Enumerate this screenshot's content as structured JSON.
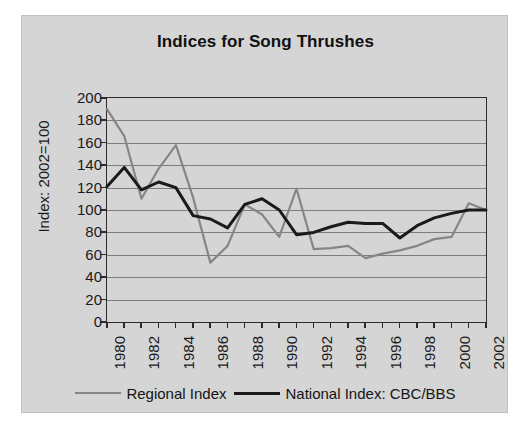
{
  "chart_data": {
    "type": "line",
    "title": "Indices for Song Thrushes",
    "xlabel": "",
    "ylabel": "Index: 2002=100",
    "xlim": [
      1980,
      2002
    ],
    "ylim": [
      0,
      200
    ],
    "yticks": [
      0,
      20,
      40,
      60,
      80,
      100,
      120,
      140,
      160,
      180,
      200
    ],
    "ytick_labels": [
      "0",
      "20",
      "40",
      "60",
      "80",
      "100",
      "120",
      "140",
      "160",
      "180",
      "200"
    ],
    "x": [
      1980,
      1981,
      1982,
      1983,
      1984,
      1985,
      1986,
      1987,
      1988,
      1989,
      1990,
      1991,
      1992,
      1993,
      1994,
      1995,
      1996,
      1997,
      1998,
      1999,
      2000,
      2001,
      2002
    ],
    "xticks": [
      1980,
      1981,
      1982,
      1983,
      1984,
      1985,
      1986,
      1987,
      1988,
      1989,
      1990,
      1991,
      1992,
      1993,
      1994,
      1995,
      1996,
      1997,
      1998,
      1999,
      2000,
      2001,
      2002
    ],
    "xtick_labels": [
      "1980",
      "",
      "1982",
      "",
      "1984",
      "",
      "1986",
      "",
      "1988",
      "",
      "1990",
      "",
      "1992",
      "",
      "1994",
      "",
      "1996",
      "",
      "1998",
      "",
      "2000",
      "",
      "2002"
    ],
    "grid": true,
    "grid_axis": "y",
    "legend_position": "bottom",
    "series": [
      {
        "name": "Regional Index",
        "color": "#868686",
        "linewidth": 2.2,
        "values": [
          190,
          166,
          110,
          137,
          158,
          111,
          53,
          68,
          105,
          96,
          76,
          119,
          65,
          66,
          68,
          57,
          61,
          64,
          68,
          74,
          76,
          106,
          100
        ]
      },
      {
        "name": "National Index: CBC/BBS",
        "color": "#1a1a1a",
        "linewidth": 3,
        "values": [
          121,
          138,
          118,
          125,
          120,
          95,
          92,
          84,
          105,
          110,
          100,
          78,
          80,
          85,
          89,
          88,
          88,
          75,
          86,
          93,
          97,
          100,
          100
        ]
      }
    ]
  },
  "legend": {
    "entries": [
      {
        "label": "Regional Index",
        "swatch": "regional"
      },
      {
        "label": "National Index: CBC/BBS",
        "swatch": "national"
      }
    ]
  },
  "colors": {
    "figure_background": "#d5d5d5",
    "page_background": "#ffffff",
    "gridline": "#7d7d7d",
    "axis": "#2b2b2b",
    "regional": "#868686",
    "national": "#1a1a1a"
  }
}
